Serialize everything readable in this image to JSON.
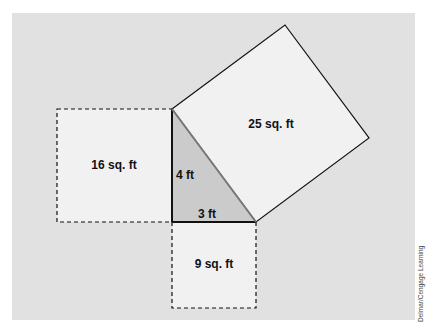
{
  "diagram": {
    "colors": {
      "page_background": "#ffffff",
      "panel_background": "#e1e1e1",
      "square_fill": "#f1f1f1",
      "triangle_fill": "#cbcbcb",
      "stroke": "#111111",
      "hypotenuse_stroke": "#777777"
    },
    "triangle": {
      "vertices": [
        [
          172,
          109
        ],
        [
          172,
          222
        ],
        [
          256,
          222
        ]
      ],
      "side_vertical_label": "4 ft",
      "side_horizontal_label": "3 ft"
    },
    "squares": [
      {
        "id": "left",
        "label": "16 sq. ft",
        "style": "dashed",
        "points": [
          [
            57,
            109
          ],
          [
            172,
            109
          ],
          [
            172,
            222
          ],
          [
            57,
            222
          ]
        ]
      },
      {
        "id": "bottom",
        "label": "9 sq. ft",
        "style": "dashed",
        "points": [
          [
            172,
            222
          ],
          [
            256,
            222
          ],
          [
            256,
            308
          ],
          [
            172,
            308
          ]
        ]
      },
      {
        "id": "hypotenuse",
        "label": "25 sq. ft",
        "style": "solid",
        "points": [
          [
            172,
            109
          ],
          [
            285,
            25
          ],
          [
            369,
            138
          ],
          [
            256,
            222
          ]
        ]
      }
    ],
    "labels": {
      "square_16": "16 sq. ft",
      "square_9": "9 sq. ft",
      "square_25": "25 sq. ft",
      "side_4": "4 ft",
      "side_3": "3 ft"
    },
    "credit": "Delmar/Cengage Learning"
  }
}
